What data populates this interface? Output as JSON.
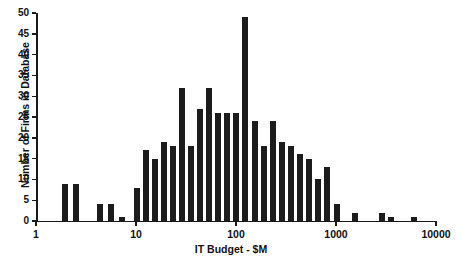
{
  "chart_data": {
    "type": "bar",
    "title": "",
    "xlabel": "IT Budget - $M",
    "ylabel": "Number of Firms in Database",
    "xscale": "log",
    "yscale": "linear",
    "xlim": [
      1,
      10000
    ],
    "ylim": [
      0,
      50
    ],
    "grid": false,
    "legend": null,
    "xtick_labels": [
      "1",
      "10",
      "100",
      "1000",
      "10000"
    ],
    "xtick_values": [
      1,
      10,
      100,
      1000,
      10000
    ],
    "ytick_labels": [
      "0",
      "5",
      "10",
      "15",
      "20",
      "25",
      "30",
      "35",
      "40",
      "45",
      "50"
    ],
    "ytick_values": [
      0,
      5,
      10,
      15,
      20,
      25,
      30,
      35,
      40,
      45,
      50
    ],
    "bar_color": "#1c1c1c",
    "bins_per_decade": 11,
    "categories": [
      "2.2",
      "2.9",
      "4.7",
      "6.2",
      "7.8",
      "11",
      "13",
      "16",
      "20",
      "25",
      "27",
      "33",
      "42",
      "50",
      "60",
      "72",
      "88",
      "120",
      "150",
      "190",
      "250",
      "300",
      "360",
      "440",
      "550",
      "680",
      "900",
      "1200",
      "1700",
      "2600",
      "3300",
      "5300"
    ],
    "values": [
      9,
      9,
      4,
      4,
      1,
      8,
      17,
      15,
      19,
      18,
      32,
      18,
      27,
      32,
      26,
      26,
      26,
      49,
      24,
      18,
      24,
      19,
      18,
      16,
      15,
      10,
      13,
      4,
      2,
      2,
      1,
      1
    ],
    "bar_x_px": [
      65,
      76,
      100,
      111,
      122,
      137,
      146,
      155,
      164,
      173,
      182,
      191,
      200,
      209,
      218,
      227,
      236,
      245,
      255,
      264,
      273,
      282,
      291,
      300,
      309,
      318,
      327,
      337,
      355,
      382,
      391,
      414
    ],
    "bar_width_px": 6.2,
    "axis_origin_px": {
      "x": 36,
      "y": 221
    },
    "px_per_decade": 100,
    "px_per_unit_y": 4.16
  }
}
